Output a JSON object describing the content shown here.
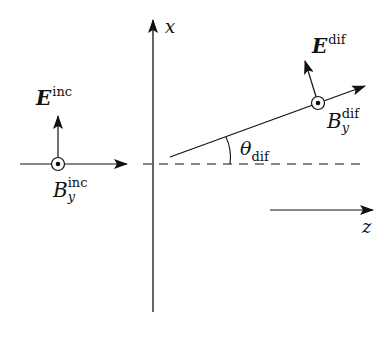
{
  "diagram": {
    "axes": {
      "x_label": "x",
      "z_label": "z"
    },
    "incident": {
      "E_symbol": "E",
      "E_sup": "inc",
      "B_symbol": "B",
      "B_sub": "y",
      "B_sup": "inc"
    },
    "diffracted": {
      "E_symbol": "E",
      "E_sup": "dif",
      "B_symbol": "B",
      "B_sub": "y",
      "B_sup": "dif",
      "angle_symbol": "θ",
      "angle_sub": "dif"
    },
    "colors": {
      "stroke": "#111111",
      "background": "#ffffff"
    }
  }
}
